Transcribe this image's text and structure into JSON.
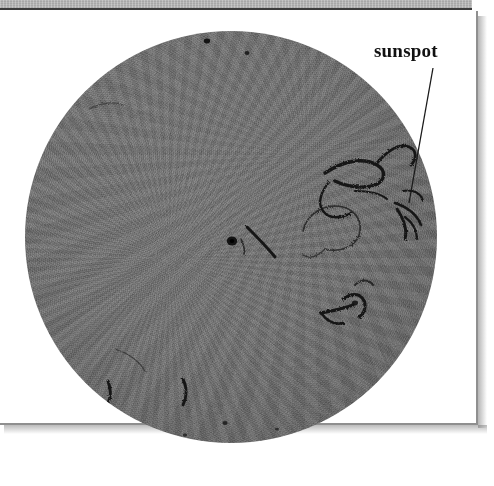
{
  "figure": {
    "kind": "photograph",
    "caption_label": "sunspot",
    "annotations": [
      {
        "label": "sunspot",
        "label_x": 374,
        "label_y": 41,
        "leader_from_x": 433,
        "leader_from_y": 68,
        "leader_to_x": 409,
        "leader_to_y": 203
      }
    ],
    "colors": {
      "panel_background": "#ffffff",
      "page_band": "#b6b6b6",
      "band_rule": "#3b3b3b",
      "panel_border": "#8f8f8f",
      "disk_mid": "#868686",
      "disk_edge": "#5f5f5f",
      "feature_dark": "#1a1a1a",
      "label_text": "#111111"
    },
    "disk": {
      "center_x": 231,
      "center_y": 237,
      "radius": 206,
      "diameter": 412,
      "left": 25,
      "top": 31
    },
    "panel": {
      "left": -2,
      "top": 11,
      "width": 480,
      "height": 414
    },
    "band": {
      "left": 0,
      "top": 0,
      "width": 472,
      "height": 10
    },
    "features": [
      {
        "name": "central-sunspot-umbra",
        "cx": 232,
        "cy": 241,
        "r": 5
      },
      {
        "name": "central-filament-streak",
        "cx": 262,
        "cy": 228
      },
      {
        "name": "upper-right-filament-arch",
        "cx": 355,
        "cy": 180
      },
      {
        "name": "right-limb-sunspot-group",
        "cx": 406,
        "cy": 205
      },
      {
        "name": "lower-right-filament-cluster",
        "cx": 356,
        "cy": 300
      },
      {
        "name": "lower-left-limb-filament-a",
        "cx": 108,
        "cy": 383
      },
      {
        "name": "lower-left-limb-filament-b",
        "cx": 183,
        "cy": 386
      },
      {
        "name": "upper-left-limb-mottling",
        "cx": 100,
        "cy": 100
      }
    ]
  }
}
